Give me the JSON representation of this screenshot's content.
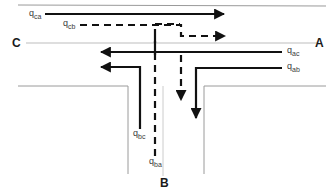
{
  "diagram": {
    "type": "road-junction-flow",
    "colors": {
      "road_edge": "#9a9a9a",
      "centerline": "#b8b8b8",
      "flow_arrow": "#111111",
      "label_text": "#3a3a3a",
      "node_text": "#1a1a1a",
      "background": "#ffffff"
    },
    "nodes": [
      {
        "id": "A",
        "label": "A",
        "x": 317,
        "y": 44,
        "description": "east-arm-terminal"
      },
      {
        "id": "B",
        "label": "B",
        "x": 163,
        "y": 183,
        "description": "south-arm-terminal"
      },
      {
        "id": "C",
        "label": "C",
        "x": 14,
        "y": 44,
        "description": "west-arm-terminal"
      }
    ],
    "flows": [
      {
        "id": "qca",
        "base": "q",
        "sub": "ca",
        "label": "q",
        "sublabel": "ca",
        "from": "C",
        "to": "A",
        "style": "solid",
        "direction": "east",
        "label_x": 29,
        "label_y": 13
      },
      {
        "id": "qcb",
        "base": "q",
        "sub": "cb",
        "label": "q",
        "sublabel": "cb",
        "from": "C",
        "to": "B",
        "style": "dashed",
        "direction": "east-then-south",
        "label_x": 63,
        "label_y": 22
      },
      {
        "id": "qac",
        "base": "q",
        "sub": "ac",
        "label": "q",
        "sublabel": "ac",
        "from": "A",
        "to": "C",
        "style": "solid",
        "direction": "west",
        "label_x": 287,
        "label_y": 49
      },
      {
        "id": "qab",
        "base": "q",
        "sub": "ab",
        "label": "q",
        "sublabel": "ab",
        "from": "A",
        "to": "B",
        "style": "solid",
        "direction": "west-then-south",
        "label_x": 287,
        "label_y": 66
      },
      {
        "id": "qbc",
        "base": "q",
        "sub": "bc",
        "label": "q",
        "sublabel": "bc",
        "from": "B",
        "to": "C",
        "style": "solid",
        "direction": "north-then-west",
        "label_x": 133,
        "label_y": 130
      },
      {
        "id": "qba",
        "base": "q",
        "sub": "ba",
        "label": "q",
        "sublabel": "ba",
        "from": "B",
        "to": "A",
        "style": "dashed",
        "direction": "north-then-east",
        "label_x": 150,
        "label_y": 158
      }
    ],
    "geometry": {
      "major_road_top_edge_y": 5,
      "major_road_bottom_edge_y": 86,
      "major_road_centerline_y": 43,
      "minor_road_left_edge_x": 128,
      "minor_road_right_edge_x": 204,
      "minor_road_centerline_x": 163,
      "minor_road_bottom_y": 174
    }
  }
}
